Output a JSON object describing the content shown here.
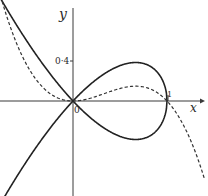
{
  "chart_data": {
    "type": "line",
    "title": "",
    "xlabel": "x",
    "ylabel": "y",
    "origin_label": "0",
    "x_ticks": [
      {
        "value": 1,
        "label": "1"
      }
    ],
    "y_ticks": [
      {
        "value": 0.4,
        "label": "0·4"
      }
    ],
    "xlim": [
      -0.78,
      1.45
    ],
    "ylim": [
      -0.95,
      1.01
    ],
    "grid": false,
    "legend": null,
    "series": [
      {
        "name": "solid curve",
        "style": "solid",
        "equation": "y^2 = x^2(1 - x)",
        "description": "Nodal cubic: self-intersecting at origin, closed loop for 0 ≤ x ≤ 1 passing through (1, 0), two branches extending to the left",
        "points_upper": [
          [
            -0.78,
            1.04
          ],
          [
            -0.5,
            0.61
          ],
          [
            -0.25,
            0.28
          ],
          [
            0,
            0
          ],
          [
            0.25,
            0.22
          ],
          [
            0.5,
            0.35
          ],
          [
            0.667,
            0.385
          ],
          [
            0.8,
            0.36
          ],
          [
            0.9,
            0.28
          ],
          [
            0.97,
            0.17
          ],
          [
            1,
            0
          ]
        ],
        "points_lower": [
          [
            -0.73,
            -0.96
          ],
          [
            -0.5,
            -0.61
          ],
          [
            -0.25,
            -0.28
          ],
          [
            0,
            0
          ],
          [
            0.25,
            -0.22
          ],
          [
            0.5,
            -0.35
          ],
          [
            0.667,
            -0.385
          ],
          [
            0.8,
            -0.36
          ],
          [
            0.9,
            -0.28
          ],
          [
            0.97,
            -0.17
          ],
          [
            1,
            0
          ]
        ]
      },
      {
        "name": "dashed curve",
        "style": "dashed",
        "equation": "y = x^2(1 - x)",
        "points": [
          [
            -0.78,
            1.08
          ],
          [
            -0.5,
            0.375
          ],
          [
            -0.25,
            0.078
          ],
          [
            0,
            0
          ],
          [
            0.25,
            0.047
          ],
          [
            0.5,
            0.125
          ],
          [
            0.667,
            0.148
          ],
          [
            0.8,
            0.128
          ],
          [
            0.9,
            0.081
          ],
          [
            1,
            0
          ],
          [
            1.2,
            -0.29
          ],
          [
            1.4,
            -0.78
          ]
        ]
      }
    ],
    "annotations": [
      {
        "text": "0·4",
        "at": [
          0,
          0.4
        ]
      },
      {
        "text": "1",
        "at": [
          1,
          0
        ]
      },
      {
        "text": "0",
        "at": [
          0,
          0
        ]
      },
      {
        "text": "x",
        "at": "x-axis end"
      },
      {
        "text": "y",
        "at": "y-axis top"
      }
    ]
  },
  "labels": {
    "x_axis": "x",
    "y_axis": "y",
    "origin": "0",
    "tick_one": "1",
    "tick_point_four": "0·4"
  },
  "colors": {
    "ink": "#2a2a2a",
    "axis": "#3a3a3a",
    "background": "#ffffff"
  }
}
